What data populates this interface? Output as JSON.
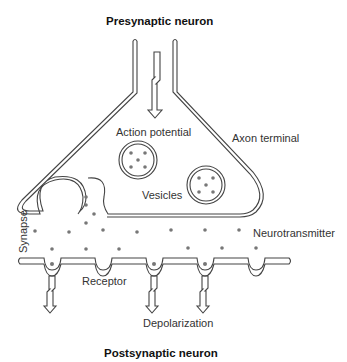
{
  "diagram": {
    "title_top": "Presynaptic neuron",
    "title_bottom": "Postsynaptic neuron",
    "labels": {
      "action_potential": "Action potential",
      "axon_terminal": "Axon terminal",
      "vesicles": "Vesicles",
      "synapse": "Synapse",
      "neurotransmitter": "Neurotransmitter",
      "receptor": "Receptor",
      "depolarization": "Depolarization"
    },
    "colors": {
      "line": "#444444",
      "dot": "#777777",
      "background": "#ffffff"
    },
    "counts": {
      "vesicles": 2,
      "receptors": 5,
      "depolarization_arrows": 3
    }
  }
}
